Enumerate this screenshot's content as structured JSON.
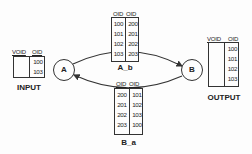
{
  "diagram": {
    "nodes": [
      {
        "id": "A",
        "label": "A"
      },
      {
        "id": "B",
        "label": "B"
      }
    ],
    "edges": [
      {
        "from": "A",
        "to": "B",
        "via_table": "A_b"
      },
      {
        "from": "B",
        "to": "A",
        "via_table": "B_a"
      }
    ],
    "tables": {
      "input": {
        "title": "INPUT",
        "headers": [
          "VOID",
          "OID"
        ],
        "left": [],
        "right": [
          "100",
          "103"
        ]
      },
      "a_b": {
        "title": "A_b",
        "headers": [
          "OID",
          "OID"
        ],
        "left": [
          "100",
          "101",
          "102",
          "103"
        ],
        "right": [
          "200",
          "201",
          "202",
          "203"
        ]
      },
      "b_a": {
        "title": "B_a",
        "headers": [
          "OID",
          "OID"
        ],
        "left": [
          "200",
          "201",
          "202",
          "203"
        ],
        "right": [
          "101",
          "102",
          "103",
          "100"
        ]
      },
      "output": {
        "title": "OUTPUT",
        "headers": [
          "VOID",
          "OID"
        ],
        "left": [],
        "right": [
          "100",
          "101",
          "102",
          "103"
        ]
      }
    }
  }
}
